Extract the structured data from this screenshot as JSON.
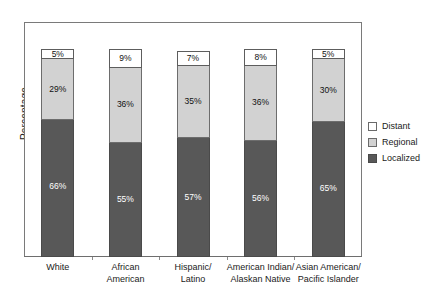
{
  "chart_data": {
    "type": "bar",
    "subtype": "stacked-bar-100",
    "title": "",
    "xlabel": "",
    "ylabel": "Percentage",
    "ylim": [
      0,
      100
    ],
    "grid": false,
    "legend_position": "right",
    "categories": [
      "White",
      "African American",
      "Hispanic/ Latino",
      "American Indian/ Alaskan Native",
      "Asian American/ Pacific Islander"
    ],
    "category_lines": [
      [
        "White"
      ],
      [
        "African",
        "American"
      ],
      [
        "Hispanic/",
        "Latino"
      ],
      [
        "American Indian/",
        "Alaskan Native"
      ],
      [
        "Asian American/",
        "Pacific Islander"
      ]
    ],
    "series": [
      {
        "name": "Distant",
        "color": "#ffffff",
        "values": [
          5,
          9,
          7,
          8,
          5
        ],
        "labels": [
          "5%",
          "9%",
          "7%",
          "8%",
          "5%"
        ]
      },
      {
        "name": "Regional",
        "color": "#d2d2d2",
        "values": [
          29,
          36,
          35,
          36,
          30
        ],
        "labels": [
          "29%",
          "36%",
          "35%",
          "36%",
          "30%"
        ]
      },
      {
        "name": "Localized",
        "color": "#585858",
        "values": [
          66,
          55,
          57,
          56,
          65
        ],
        "labels": [
          "66%",
          "55%",
          "57%",
          "56%",
          "65%"
        ]
      }
    ],
    "stack_order_top_to_bottom": [
      "Distant",
      "Regional",
      "Localized"
    ]
  },
  "legend": {
    "items": [
      {
        "label": "Distant",
        "color": "#ffffff"
      },
      {
        "label": "Regional",
        "color": "#d2d2d2"
      },
      {
        "label": "Localized",
        "color": "#585858"
      }
    ]
  },
  "axes": {
    "y_title": "Percentage"
  }
}
